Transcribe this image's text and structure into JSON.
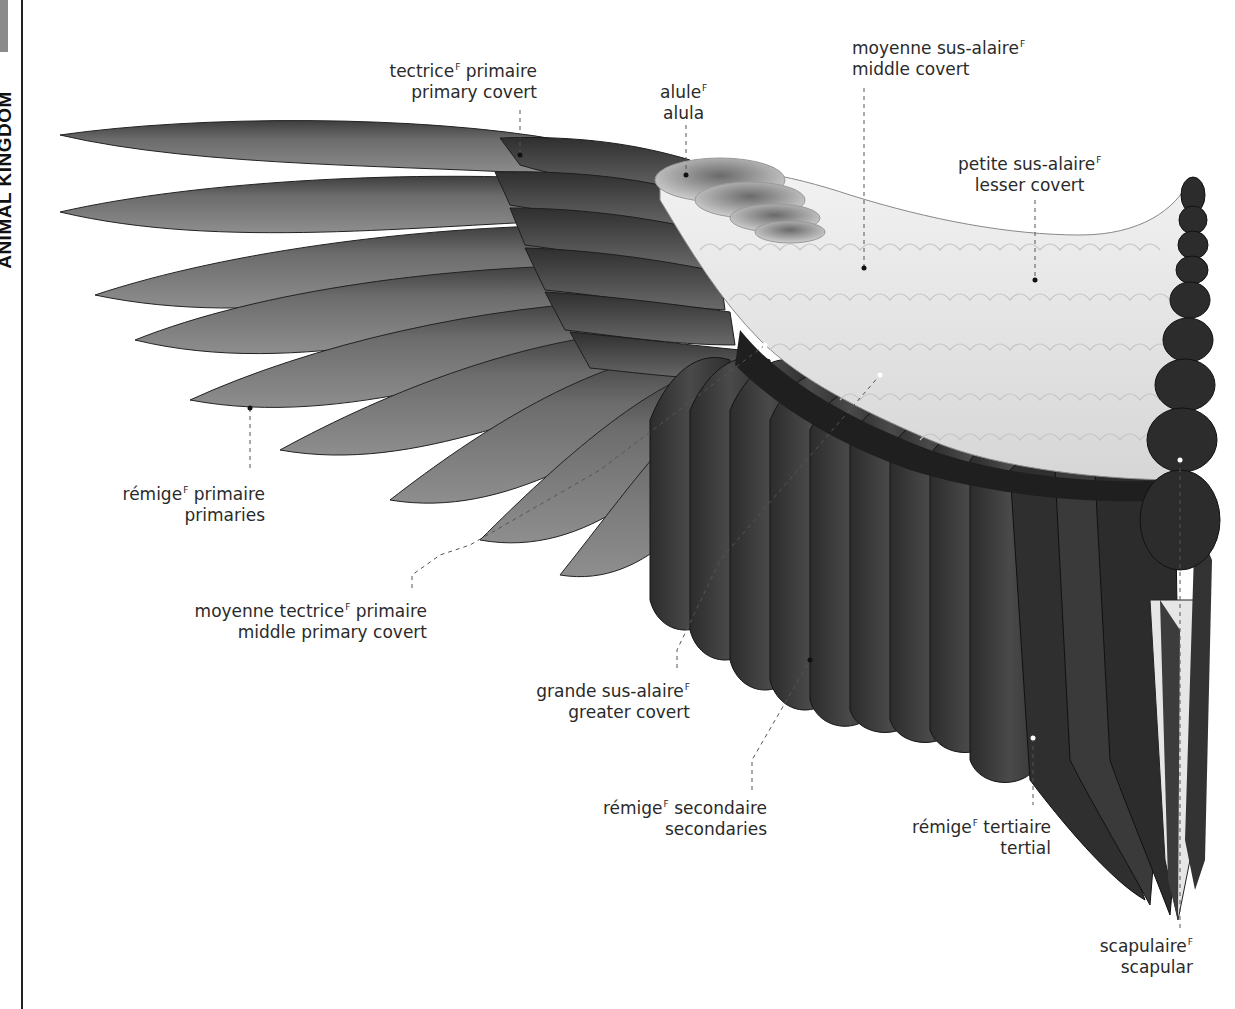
{
  "page": {
    "side_title": "ANIMAL KINGDOM",
    "gender_marker": "F"
  },
  "colors": {
    "primaries": "#7a7a7a",
    "primary_dark": "#4a4a4a",
    "secondaries": "#3b3b3b",
    "coverts_light": "#e4e4e4",
    "scapular_dark": "#2e2e2e",
    "leader_line": "#555555"
  },
  "labels": [
    {
      "id": "primary-covert",
      "fr": "tectrice",
      "fr_suffix": " primaire",
      "en": "primary covert"
    },
    {
      "id": "alula",
      "fr": "alule",
      "fr_suffix": "",
      "en": "alula"
    },
    {
      "id": "middle-covert",
      "fr": "moyenne sus-alaire",
      "fr_suffix": "",
      "en": "middle covert"
    },
    {
      "id": "lesser-covert",
      "fr": "petite sus-alaire",
      "fr_suffix": "",
      "en": "lesser covert"
    },
    {
      "id": "primaries",
      "fr": "rémige",
      "fr_suffix": " primaire",
      "en": "primaries"
    },
    {
      "id": "middle-primary-covert",
      "fr": "moyenne tectrice",
      "fr_suffix": " primaire",
      "en": "middle primary covert"
    },
    {
      "id": "greater-covert",
      "fr": "grande sus-alaire",
      "fr_suffix": "",
      "en": "greater covert"
    },
    {
      "id": "secondaries",
      "fr": "rémige",
      "fr_suffix": " secondaire",
      "en": "secondaries"
    },
    {
      "id": "tertial",
      "fr": "rémige",
      "fr_suffix": " tertiaire",
      "en": "tertial"
    },
    {
      "id": "scapular",
      "fr": "scapulaire",
      "fr_suffix": "",
      "en": "scapular"
    }
  ]
}
